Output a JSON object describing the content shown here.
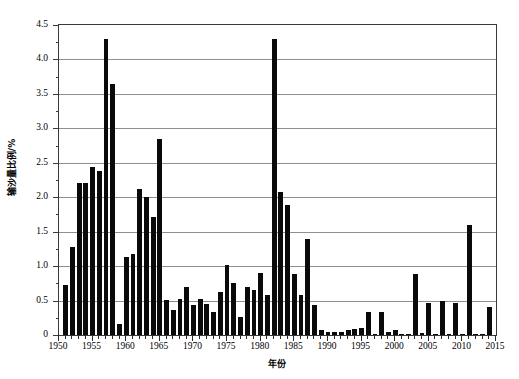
{
  "chart_data": {
    "type": "bar",
    "title": "",
    "xlabel": "年份",
    "ylabel": "输沙量比例/%",
    "xlim": [
      1950,
      2015
    ],
    "ylim": [
      0,
      4.5
    ],
    "grid": true,
    "legend": null,
    "y_ticks": [
      "0",
      "0.5",
      "1.0",
      "1.5",
      "2.0",
      "2.5",
      "3.0",
      "3.5",
      "4.0",
      "4.5"
    ],
    "y_tick_values": [
      0,
      0.5,
      1.0,
      1.5,
      2.0,
      2.5,
      3.0,
      3.5,
      4.0,
      4.5
    ],
    "y_minor_step": 0.25,
    "x_ticks": [
      "1950",
      "1955",
      "1960",
      "1965",
      "1970",
      "1975",
      "1980",
      "1985",
      "1990",
      "1995",
      "2000",
      "2005",
      "2010",
      "2015"
    ],
    "x_tick_values": [
      1950,
      1955,
      1960,
      1965,
      1970,
      1975,
      1980,
      1985,
      1990,
      1995,
      2000,
      2005,
      2010,
      2015
    ],
    "bar_color": "#0a0a0a",
    "grid_color": "#8f8f8f",
    "frame_color": "#3a3a3a",
    "categories": [
      1951,
      1952,
      1953,
      1954,
      1955,
      1956,
      1957,
      1958,
      1959,
      1960,
      1961,
      1962,
      1963,
      1964,
      1965,
      1966,
      1967,
      1968,
      1969,
      1970,
      1971,
      1972,
      1973,
      1974,
      1975,
      1976,
      1977,
      1978,
      1979,
      1980,
      1981,
      1982,
      1983,
      1984,
      1985,
      1986,
      1987,
      1988,
      1989,
      1990,
      1991,
      1992,
      1993,
      1994,
      1995,
      1996,
      1997,
      1998,
      1999,
      2000,
      2001,
      2002,
      2003,
      2004,
      2005,
      2006,
      2007,
      2008,
      2009,
      2010,
      2011,
      2012,
      2013,
      2014
    ],
    "values": [
      0.73,
      1.28,
      2.21,
      2.21,
      2.44,
      2.38,
      4.29,
      3.64,
      0.16,
      1.13,
      1.18,
      2.12,
      2.0,
      1.72,
      2.84,
      0.51,
      0.37,
      0.53,
      0.7,
      0.43,
      0.52,
      0.45,
      0.34,
      0.63,
      1.02,
      0.75,
      0.26,
      0.69,
      0.65,
      0.9,
      0.58,
      4.29,
      2.07,
      1.89,
      0.89,
      0.58,
      1.4,
      0.43,
      0.08,
      0.05,
      0.04,
      0.05,
      0.07,
      0.09,
      0.1,
      0.34,
      0.02,
      0.33,
      0.04,
      0.07,
      0.01,
      0.01,
      0.89,
      0.03,
      0.46,
      0.01,
      0.49,
      0.01,
      0.46,
      0.01,
      1.6,
      0.01,
      0.01,
      0.4
    ]
  }
}
